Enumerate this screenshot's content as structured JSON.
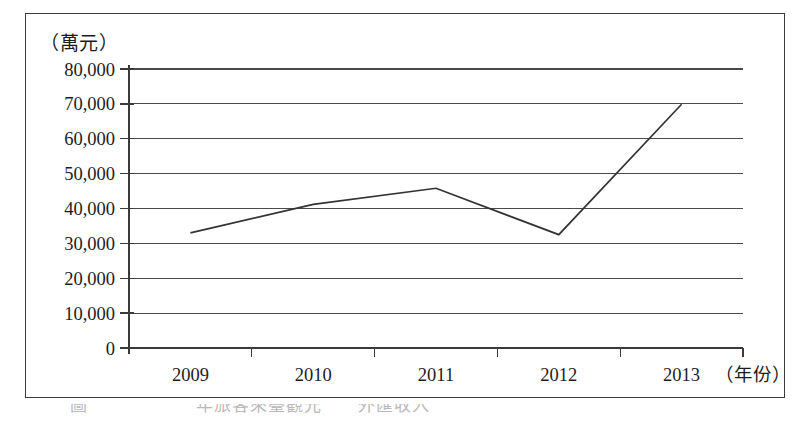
{
  "figure": {
    "y_unit_caption": "（萬元）",
    "x_axis_caption": "（年份）",
    "bottom_caption_fragment": "圖　　　　　　年旅客來臺觀光　　外匯收入　　　　　　　　　"
  },
  "chart_data": {
    "type": "line",
    "title": "",
    "subtitle": "",
    "xlabel": "（年份）",
    "ylabel": "（萬元）",
    "categories": [
      "2009",
      "2010",
      "2011",
      "2012",
      "2013"
    ],
    "values": [
      33000,
      41200,
      45800,
      32500,
      69900
    ],
    "series": [
      {
        "name": "",
        "values": [
          33000,
          41200,
          45800,
          32500,
          69900
        ]
      }
    ],
    "ylim": [
      0,
      80000
    ],
    "ytick_values": [
      0,
      10000,
      20000,
      30000,
      40000,
      50000,
      60000,
      70000,
      80000
    ],
    "ytick_labels": [
      "0",
      "10,000",
      "20,000",
      "30,000",
      "40,000",
      "50,000",
      "60,000",
      "70,000",
      "80,000"
    ],
    "xtick_labels": [
      "2009",
      "2010",
      "2011",
      "2012",
      "2013"
    ],
    "grid": true,
    "grid_axis": "y",
    "legend": false,
    "legend_position": "none",
    "markers": false,
    "line_color": "#333333",
    "grid_color": "#4a4a4a",
    "background_color": "#ffffff",
    "annotations": []
  }
}
